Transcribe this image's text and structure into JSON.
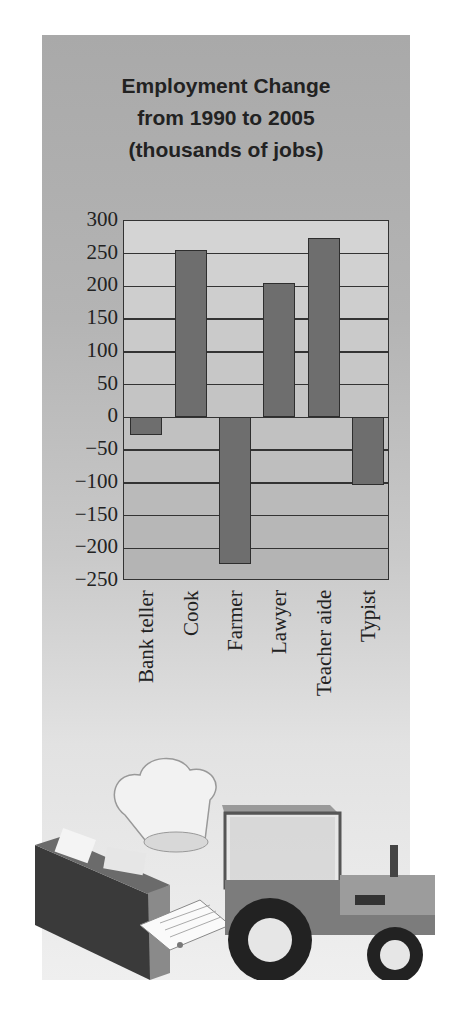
{
  "chart_data": {
    "type": "bar",
    "title": "Employment Change from 1990 to 2005 (thousands of jobs)",
    "title_lines": [
      "Employment Change",
      "from 1990 to 2005",
      "(thousands of jobs)"
    ],
    "categories": [
      "Bank teller",
      "Cook",
      "Farmer",
      "Lawyer",
      "Teacher aide",
      "Typist"
    ],
    "values": [
      -27,
      256,
      -224,
      205,
      274,
      -104
    ],
    "xlabel": "",
    "ylabel": "",
    "ylim": [
      -250,
      300
    ],
    "yticks": [
      "300",
      "250",
      "200",
      "150",
      "100",
      "50",
      "0",
      "-50",
      "-100",
      "-150",
      "-200",
      "-250"
    ],
    "grid": true,
    "legend": null,
    "colors": {
      "bar": "#6e6e6e",
      "bar_border": "#2e2e2e",
      "grid": "#333333",
      "plot_bg": "#c8c8c8"
    }
  },
  "illustration": {
    "items": [
      "chef-hat",
      "file-folder-with-papers",
      "tractor"
    ]
  }
}
